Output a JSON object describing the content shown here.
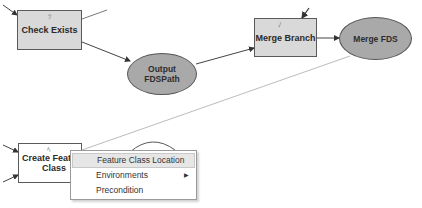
{
  "diagram": {
    "type": "model-builder",
    "nodes": [
      {
        "id": "check_exists",
        "shape": "rectangle",
        "fill": "#d9d9d9",
        "label": "Check Exists"
      },
      {
        "id": "output_fdspath",
        "shape": "ellipse",
        "fill": "#a9a9a9",
        "label_line1": "Output",
        "label_line2": "FDSPath"
      },
      {
        "id": "merge_branch",
        "shape": "rectangle",
        "fill": "#d9d9d9",
        "label": "Merge Branch"
      },
      {
        "id": "merge_fds",
        "shape": "ellipse",
        "fill": "#a9a9a9",
        "label": "Merge FDS"
      },
      {
        "id": "create_feature_class",
        "shape": "rectangle",
        "fill": "#ffffff",
        "label_line1": "Create Featu",
        "label_line2": "Class"
      }
    ],
    "edges": [
      {
        "from": "check_exists",
        "to": "output_fdspath"
      },
      {
        "from": "output_fdspath",
        "to": "merge_branch"
      },
      {
        "from": "merge_branch",
        "to": "merge_fds"
      },
      {
        "from": "merge_fds",
        "to": "create_feature_class",
        "style": "precondition-thin"
      }
    ]
  },
  "context_menu": {
    "items": [
      {
        "label": "Feature Class Location",
        "highlighted": true,
        "has_submenu": false
      },
      {
        "label": "Environments",
        "highlighted": false,
        "has_submenu": true
      },
      {
        "label": "Precondition",
        "highlighted": false,
        "has_submenu": false
      }
    ],
    "submenu_arrow": "▶"
  },
  "colors": {
    "tool_fill": "#d9d9d9",
    "variable_fill": "#a9a9a9",
    "menu_highlight": "#e6e6e6"
  }
}
